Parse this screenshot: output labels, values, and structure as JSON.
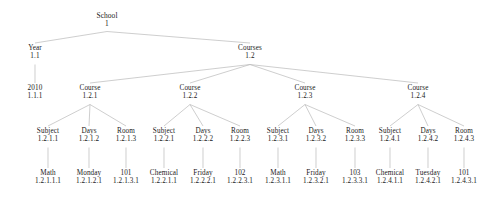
{
  "diagram": {
    "type": "tree",
    "line_color": "#b9b9b9",
    "text_color": "#1a1a1a",
    "background": "#ffffff",
    "nodes": [
      {
        "key": "school",
        "name": "School",
        "id": "1",
        "x": 107,
        "y": 12,
        "level": 0
      },
      {
        "key": "year",
        "name": "Year",
        "id": "1.1",
        "x": 35,
        "y": 45,
        "level": 1
      },
      {
        "key": "courses",
        "name": "Courses",
        "id": "1.2",
        "x": 250,
        "y": 45,
        "level": 1
      },
      {
        "key": "y2010",
        "name": "2010",
        "id": "1.1.1",
        "x": 35,
        "y": 85,
        "level": 2
      },
      {
        "key": "course1",
        "name": "Course",
        "id": "1.2.1",
        "x": 90,
        "y": 85,
        "level": 2
      },
      {
        "key": "course2",
        "name": "Course",
        "id": "1.2.2",
        "x": 190,
        "y": 85,
        "level": 2
      },
      {
        "key": "course3",
        "name": "Course",
        "id": "1.2.3",
        "x": 305,
        "y": 85,
        "level": 2
      },
      {
        "key": "course4",
        "name": "Course",
        "id": "1.2.4",
        "x": 418,
        "y": 85,
        "level": 2
      },
      {
        "key": "c1subject",
        "name": "Subject",
        "id": "1.2.1.1",
        "x": 48,
        "y": 128,
        "level": 3
      },
      {
        "key": "c1days",
        "name": "Days",
        "id": "1.2.1.2",
        "x": 89,
        "y": 128,
        "level": 3
      },
      {
        "key": "c1room",
        "name": "Room",
        "id": "1.2.1.3",
        "x": 126,
        "y": 128,
        "level": 3
      },
      {
        "key": "c2subject",
        "name": "Subject",
        "id": "1.2.2.1",
        "x": 164,
        "y": 128,
        "level": 3
      },
      {
        "key": "c2days",
        "name": "Days",
        "id": "1.2.2.2",
        "x": 203,
        "y": 128,
        "level": 3
      },
      {
        "key": "c2room",
        "name": "Room",
        "id": "1.2.2.3",
        "x": 240,
        "y": 128,
        "level": 3
      },
      {
        "key": "c3subject",
        "name": "Subject",
        "id": "1.2.3.1",
        "x": 278,
        "y": 128,
        "level": 3
      },
      {
        "key": "c3days",
        "name": "Days",
        "id": "1.2.3.2",
        "x": 316,
        "y": 128,
        "level": 3
      },
      {
        "key": "c3room",
        "name": "Room",
        "id": "1.2.3.3",
        "x": 355,
        "y": 128,
        "level": 3
      },
      {
        "key": "c4subject",
        "name": "Subject",
        "id": "1.2.4.1",
        "x": 390,
        "y": 128,
        "level": 3
      },
      {
        "key": "c4days",
        "name": "Days",
        "id": "1.2.4.2",
        "x": 428,
        "y": 128,
        "level": 3
      },
      {
        "key": "c4room",
        "name": "Room",
        "id": "1.2.4.3",
        "x": 464,
        "y": 128,
        "level": 3
      },
      {
        "key": "c1subjectv",
        "name": "Math",
        "id": "1.2.1.1.1",
        "x": 48,
        "y": 170,
        "level": 4
      },
      {
        "key": "c1daysv",
        "name": "Monday",
        "id": "1.2.1.2.1",
        "x": 89,
        "y": 170,
        "level": 4
      },
      {
        "key": "c1roomv",
        "name": "101",
        "id": "1.2.1.3.1",
        "x": 126,
        "y": 170,
        "level": 4
      },
      {
        "key": "c2subjectv",
        "name": "Chemical",
        "id": "1.2.2.1.1",
        "x": 164,
        "y": 170,
        "level": 4
      },
      {
        "key": "c2daysv",
        "name": "Friday",
        "id": "1.2.2.2.1",
        "x": 203,
        "y": 170,
        "level": 4
      },
      {
        "key": "c2roomv",
        "name": "102",
        "id": "1.2.2.3.1",
        "x": 240,
        "y": 170,
        "level": 4
      },
      {
        "key": "c3subjectv",
        "name": "Math",
        "id": "1.2.3.1.1",
        "x": 278,
        "y": 170,
        "level": 4
      },
      {
        "key": "c3daysv",
        "name": "Friday",
        "id": "1.2.3.2.1",
        "x": 316,
        "y": 170,
        "level": 4
      },
      {
        "key": "c3roomv",
        "name": "103",
        "id": "1.2.3.3.1",
        "x": 355,
        "y": 170,
        "level": 4
      },
      {
        "key": "c4subjectv",
        "name": "Chemical",
        "id": "1.2.4.1.1",
        "x": 390,
        "y": 170,
        "level": 4
      },
      {
        "key": "c4daysv",
        "name": "Tuesday",
        "id": "1.2.4.2.1",
        "x": 428,
        "y": 170,
        "level": 4
      },
      {
        "key": "c4roomv",
        "name": "101",
        "id": "1.2.4.3.1",
        "x": 464,
        "y": 170,
        "level": 4
      }
    ],
    "edges": [
      {
        "from": "school",
        "to": "year"
      },
      {
        "from": "school",
        "to": "courses"
      },
      {
        "from": "year",
        "to": "y2010"
      },
      {
        "from": "courses",
        "to": "course1"
      },
      {
        "from": "courses",
        "to": "course2"
      },
      {
        "from": "courses",
        "to": "course3"
      },
      {
        "from": "courses",
        "to": "course4"
      },
      {
        "from": "course1",
        "to": "c1subject"
      },
      {
        "from": "course1",
        "to": "c1days"
      },
      {
        "from": "course1",
        "to": "c1room"
      },
      {
        "from": "course2",
        "to": "c2subject"
      },
      {
        "from": "course2",
        "to": "c2days"
      },
      {
        "from": "course2",
        "to": "c2room"
      },
      {
        "from": "course3",
        "to": "c3subject"
      },
      {
        "from": "course3",
        "to": "c3days"
      },
      {
        "from": "course3",
        "to": "c3room"
      },
      {
        "from": "course4",
        "to": "c4subject"
      },
      {
        "from": "course4",
        "to": "c4days"
      },
      {
        "from": "course4",
        "to": "c4room"
      },
      {
        "from": "c1subject",
        "to": "c1subjectv"
      },
      {
        "from": "c1days",
        "to": "c1daysv"
      },
      {
        "from": "c1room",
        "to": "c1roomv"
      },
      {
        "from": "c2subject",
        "to": "c2subjectv"
      },
      {
        "from": "c2days",
        "to": "c2daysv"
      },
      {
        "from": "c2room",
        "to": "c2roomv"
      },
      {
        "from": "c3subject",
        "to": "c3subjectv"
      },
      {
        "from": "c3days",
        "to": "c3daysv"
      },
      {
        "from": "c3room",
        "to": "c3roomv"
      },
      {
        "from": "c4subject",
        "to": "c4subjectv"
      },
      {
        "from": "c4days",
        "to": "c4daysv"
      },
      {
        "from": "c4room",
        "to": "c4roomv"
      }
    ]
  }
}
